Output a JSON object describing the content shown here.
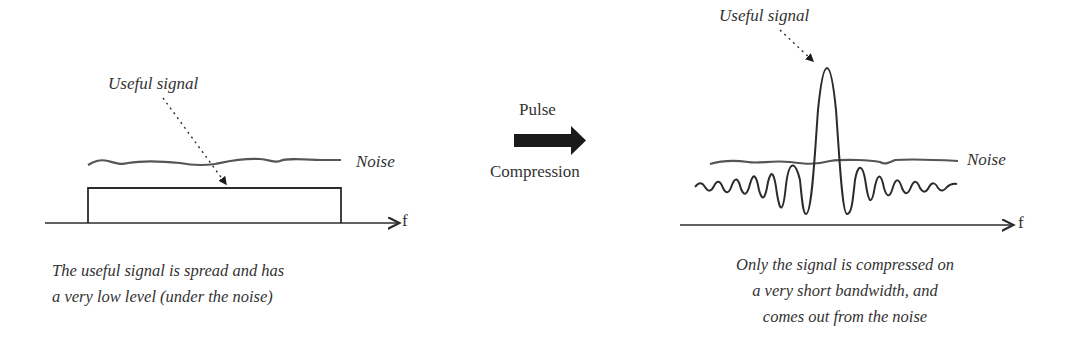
{
  "left_panel": {
    "signal_label": "Useful signal",
    "noise_label": "Noise",
    "axis_label": "f",
    "caption_lines": [
      "The useful signal is spread and has",
      "a very low level (under the noise)"
    ]
  },
  "transition": {
    "top_label": "Pulse",
    "bottom_label": "Compression",
    "icon": "right-arrow-icon"
  },
  "right_panel": {
    "signal_label": "Useful signal",
    "noise_label": "Noise",
    "axis_label": "f",
    "caption_lines": [
      "Only the signal is compressed on",
      "a very short bandwidth, and",
      "comes out from the noise"
    ]
  },
  "colors": {
    "stroke": "#2b2b2b",
    "noise": "#555555",
    "arrow": "#1a1a1a"
  }
}
